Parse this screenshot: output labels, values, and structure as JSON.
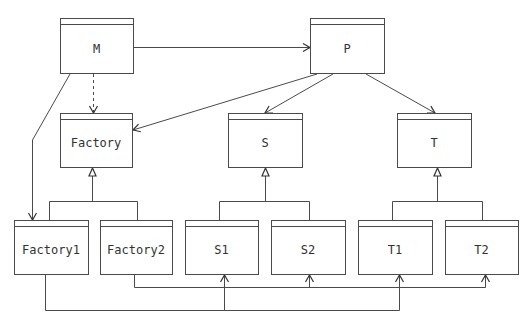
{
  "diagram": {
    "type": "class-diagram",
    "classes": [
      {
        "id": "M",
        "label": "M"
      },
      {
        "id": "P",
        "label": "P"
      },
      {
        "id": "Factory",
        "label": "Factory"
      },
      {
        "id": "S",
        "label": "S"
      },
      {
        "id": "T",
        "label": "T"
      },
      {
        "id": "Factory1",
        "label": "Factory1"
      },
      {
        "id": "Factory2",
        "label": "Factory2"
      },
      {
        "id": "S1",
        "label": "S1"
      },
      {
        "id": "S2",
        "label": "S2"
      },
      {
        "id": "T1",
        "label": "T1"
      },
      {
        "id": "T2",
        "label": "T2"
      }
    ],
    "relations": [
      {
        "from": "M",
        "to": "P",
        "kind": "association"
      },
      {
        "from": "M",
        "to": "Factory",
        "kind": "dependency"
      },
      {
        "from": "M",
        "to": "Factory1",
        "kind": "association"
      },
      {
        "from": "P",
        "to": "Factory",
        "kind": "association"
      },
      {
        "from": "P",
        "to": "S",
        "kind": "association"
      },
      {
        "from": "P",
        "to": "T",
        "kind": "association"
      },
      {
        "from": "Factory1",
        "to": "Factory",
        "kind": "inheritance"
      },
      {
        "from": "Factory2",
        "to": "Factory",
        "kind": "inheritance"
      },
      {
        "from": "S1",
        "to": "S",
        "kind": "inheritance"
      },
      {
        "from": "S2",
        "to": "S",
        "kind": "inheritance"
      },
      {
        "from": "T1",
        "to": "T",
        "kind": "inheritance"
      },
      {
        "from": "T2",
        "to": "T",
        "kind": "inheritance"
      },
      {
        "from": "Factory1",
        "to": "S1",
        "kind": "association"
      },
      {
        "from": "Factory1",
        "to": "T1",
        "kind": "association"
      },
      {
        "from": "Factory2",
        "to": "S2",
        "kind": "association"
      },
      {
        "from": "Factory2",
        "to": "T2",
        "kind": "association"
      }
    ]
  }
}
